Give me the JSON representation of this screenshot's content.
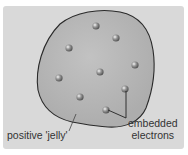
{
  "diagram": {
    "labels": {
      "jelly": "positive 'jelly'",
      "embedded_line1": "embedded",
      "embedded_line2": "electrons"
    },
    "colors": {
      "background": "#d9d9d9",
      "sphere": "#b9b9b9",
      "outline": "#2a2a2a",
      "electron": "#8a8a8a"
    },
    "electrons": [
      {
        "x": 96,
        "y": 26
      },
      {
        "x": 116,
        "y": 38
      },
      {
        "x": 69,
        "y": 48
      },
      {
        "x": 135,
        "y": 65
      },
      {
        "x": 100,
        "y": 72
      },
      {
        "x": 59,
        "y": 78
      },
      {
        "x": 125,
        "y": 89
      },
      {
        "x": 80,
        "y": 97
      },
      {
        "x": 106,
        "y": 110
      }
    ]
  }
}
